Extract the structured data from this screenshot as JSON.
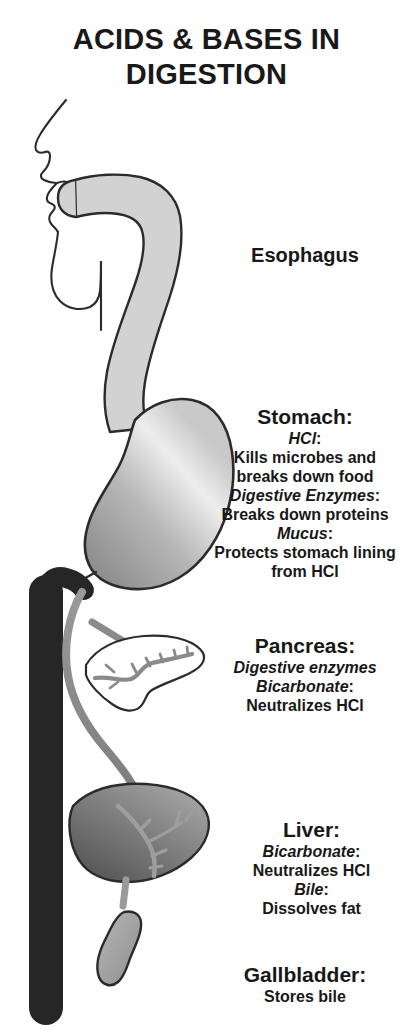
{
  "title": {
    "line1": "ACIDS & BASES IN",
    "line2": "DIGESTION"
  },
  "labels": {
    "esophagus": {
      "heading": "Esophagus"
    },
    "stomach": {
      "heading": "Stomach:",
      "sub1": "HCl",
      "sub1_colon": ":",
      "text1_line1": "Kills microbes and",
      "text1_line2": "breaks down food",
      "sub2": "Digestive Enzymes",
      "sub2_colon": ":",
      "text2": "Breaks down proteins",
      "sub3": "Mucus",
      "sub3_colon": ":",
      "text3_line1": "Protects stomach lining",
      "text3_line2": "from HCl"
    },
    "pancreas": {
      "heading": "Pancreas:",
      "sub1": "Digestive enzymes",
      "sub2": "Bicarbonate",
      "sub2_colon": ":",
      "text2": "Neutralizes HCl"
    },
    "liver": {
      "heading": "Liver:",
      "sub1": "Bicarbonate",
      "sub1_colon": ":",
      "text1": "Neutralizes HCl",
      "sub2": "Bile",
      "sub2_colon": ":",
      "text2": "Dissolves fat"
    },
    "gallbladder": {
      "heading": "Gallbladder:",
      "text1": "Stores bile"
    }
  },
  "organs": {
    "head_profile": "head-profile",
    "esophagus": "esophagus-tube",
    "stomach": "stomach-organ",
    "intestine": "intestine-column",
    "pancreas": "pancreas-organ",
    "liver": "liver-organ",
    "gallbladder": "gallbladder-organ",
    "bile_duct": "bile-duct"
  },
  "colors": {
    "background": "#ffffff",
    "text": "#181818",
    "outline": "#2b2b2b",
    "esophagus_fill": "#d2d2d2",
    "stomach_light": "#f0f0f0",
    "stomach_dark": "#8e8e8e",
    "intestine_fill": "#262626",
    "pancreas_fill": "#ffffff",
    "duct_gray": "#8a8a8a",
    "liver_light": "#9a9a9a",
    "liver_dark": "#5a5a5a",
    "gallbladder_fill": "#a8a8a8"
  }
}
